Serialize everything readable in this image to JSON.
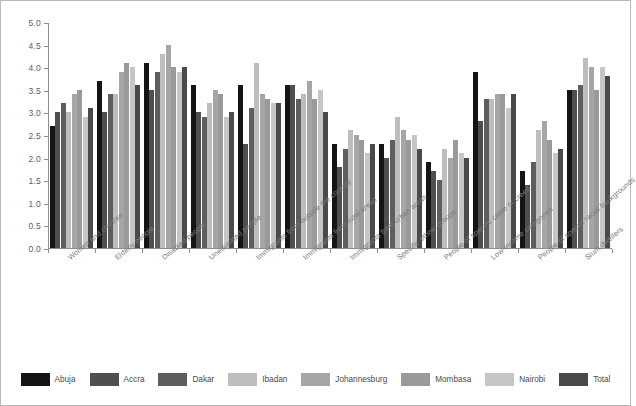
{
  "chart_data": {
    "type": "bar",
    "title": "",
    "subtitle": "",
    "xlabel": "",
    "ylabel": "",
    "ylim": [
      0.0,
      5.0
    ],
    "ytick_step": 0.5,
    "ytick_labels": [
      "0.0",
      "0.5",
      "1.0",
      "1.5",
      "2.0",
      "2.5",
      "3.0",
      "3.5",
      "4.0",
      "4.5",
      "5.0"
    ],
    "grid": false,
    "legend_position": "bottom",
    "categories": [
      "Women and children",
      "Elderly people",
      "Disabled people",
      "Uneducated people",
      "Immigrants from outside the country",
      "Immigrants from rural areas",
      "Immigrants from urban areas",
      "Specific ethnic groups",
      "People of specific caste or creed",
      "Low-income categories",
      "People of special racial backgrounds",
      "Slum dwellers"
    ],
    "series": [
      {
        "name": "Abuja",
        "color": "#141414",
        "values": [
          2.7,
          3.7,
          4.1,
          3.6,
          3.6,
          3.6,
          2.3,
          2.3,
          1.9,
          3.9,
          1.7,
          3.5
        ]
      },
      {
        "name": "Accra",
        "color": "#4f4f4f",
        "values": [
          3.0,
          3.0,
          3.5,
          3.0,
          2.3,
          3.6,
          1.8,
          2.0,
          1.7,
          2.8,
          1.4,
          3.5
        ]
      },
      {
        "name": "Dakar",
        "color": "#5e5e5e",
        "values": [
          3.2,
          3.4,
          3.9,
          2.9,
          3.1,
          3.3,
          2.2,
          2.4,
          1.5,
          3.3,
          1.9,
          3.6
        ]
      },
      {
        "name": "Ibadan",
        "color": "#bdbdbd",
        "values": [
          3.0,
          3.4,
          4.3,
          3.2,
          4.1,
          3.4,
          2.6,
          2.9,
          2.2,
          3.3,
          2.6,
          4.2
        ]
      },
      {
        "name": "Johannesburg",
        "color": "#a6a6a6",
        "values": [
          3.4,
          3.9,
          4.5,
          3.5,
          3.4,
          3.7,
          2.5,
          2.6,
          2.0,
          3.4,
          2.8,
          4.0
        ]
      },
      {
        "name": "Mombasa",
        "color": "#9a9a9a",
        "values": [
          3.5,
          4.1,
          4.0,
          3.4,
          3.3,
          3.3,
          2.4,
          2.4,
          2.4,
          3.4,
          2.4,
          3.5
        ]
      },
      {
        "name": "Nairobi",
        "color": "#c6c6c6",
        "values": [
          2.9,
          4.0,
          3.9,
          2.9,
          3.2,
          3.5,
          2.1,
          2.5,
          2.1,
          3.1,
          2.1,
          4.0
        ]
      },
      {
        "name": "Total",
        "color": "#4a4a4a",
        "values": [
          3.1,
          3.6,
          4.0,
          3.0,
          3.2,
          3.0,
          2.3,
          2.2,
          2.0,
          3.4,
          2.2,
          3.8
        ]
      }
    ]
  },
  "legend": {
    "items": [
      {
        "label": "Abuja"
      },
      {
        "label": "Accra"
      },
      {
        "label": "Dakar"
      },
      {
        "label": "Ibadan"
      },
      {
        "label": "Johannesburg"
      },
      {
        "label": "Mombasa"
      },
      {
        "label": "Nairobi"
      },
      {
        "label": "Total"
      }
    ]
  }
}
